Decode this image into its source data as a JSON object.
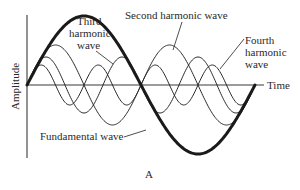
{
  "figure": {
    "caption": "A",
    "x_axis_label": "Time",
    "y_axis_label": "Amplitude"
  },
  "labels": {
    "fundamental": "Fundamental wave",
    "second": "Second harmonic wave",
    "third_line1": "Third",
    "third_line2": "harmonic",
    "third_line3": "wave",
    "fourth_line1": "Fourth",
    "fourth_line2": "harmonic",
    "fourth_line3": "wave"
  },
  "colors": {
    "ink": "#1a1a1a",
    "background": "#ffffff"
  },
  "waves": {
    "x_start": 27,
    "x_end": 255,
    "baseline_y": 85,
    "fundamental_amplitude": 69,
    "harmonics": [
      {
        "name": "second",
        "order": 2,
        "amplitude": 40
      },
      {
        "name": "third",
        "order": 3,
        "amplitude": 28
      },
      {
        "name": "fourth",
        "order": 4,
        "amplitude": 20
      }
    ]
  }
}
